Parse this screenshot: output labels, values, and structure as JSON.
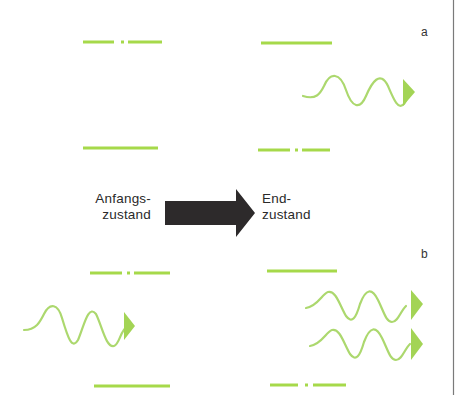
{
  "diagram": {
    "panels": [
      {
        "id": "a",
        "label": "a"
      },
      {
        "id": "b",
        "label": "b"
      }
    ],
    "initial_state": {
      "line1": "Anfangs-",
      "line2": "zustand"
    },
    "final_state": {
      "line1": "End-",
      "line2": "zustand"
    },
    "colors": {
      "level_green": "#a6d94a",
      "wave_green": "#a9d66a",
      "arrow_dark": "#2d2a2b",
      "border": "#777777",
      "text": "#2a2a2a"
    }
  }
}
